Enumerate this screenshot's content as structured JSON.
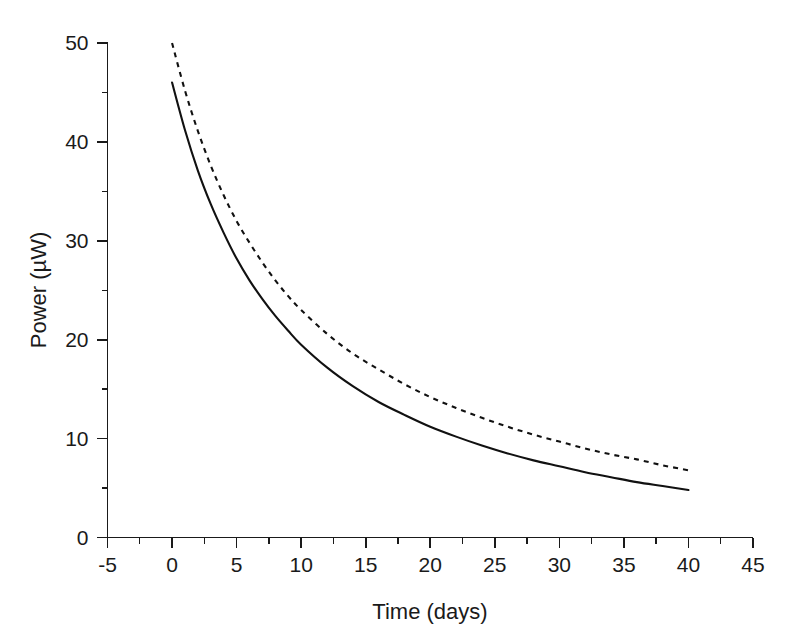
{
  "chart_data": {
    "type": "line",
    "title": "",
    "xlabel": "Time (days)",
    "ylabel": "Power (µW)",
    "xlim": [
      -5,
      45
    ],
    "ylim": [
      0,
      50
    ],
    "xticks": [
      -5,
      0,
      5,
      10,
      15,
      20,
      25,
      30,
      35,
      40,
      45
    ],
    "yticks": [
      0,
      10,
      20,
      30,
      40,
      50
    ],
    "xtick_labels": [
      "-5",
      "0",
      "5",
      "10",
      "15",
      "20",
      "25",
      "30",
      "35",
      "40",
      "45"
    ],
    "ytick_labels": [
      "0",
      "10",
      "20",
      "30",
      "40",
      "50"
    ],
    "x_minor_interval": 2.5,
    "y_minor_interval": 5,
    "grid": false,
    "legend": "none",
    "x": [
      0,
      1,
      2,
      3,
      4,
      5,
      6,
      7,
      8,
      9,
      10,
      12,
      14,
      16,
      18,
      20,
      22,
      24,
      26,
      28,
      30,
      32,
      34,
      36,
      38,
      40
    ],
    "series": [
      {
        "name": "dashed-curve",
        "style": "dashed",
        "color": "#111111",
        "values": [
          50.0,
          45.2,
          41.1,
          37.6,
          34.6,
          32.0,
          29.8,
          27.8,
          26.0,
          24.4,
          23.0,
          20.6,
          18.6,
          17.0,
          15.5,
          14.2,
          13.1,
          12.1,
          11.2,
          10.4,
          9.7,
          9.0,
          8.4,
          7.9,
          7.3,
          6.8
        ]
      },
      {
        "name": "solid-curve",
        "style": "solid",
        "color": "#111111",
        "values": [
          46.0,
          41.2,
          37.1,
          33.7,
          30.8,
          28.2,
          26.0,
          24.1,
          22.4,
          20.9,
          19.5,
          17.2,
          15.3,
          13.7,
          12.4,
          11.2,
          10.2,
          9.3,
          8.5,
          7.8,
          7.2,
          6.6,
          6.1,
          5.6,
          5.2,
          4.8
        ]
      }
    ]
  },
  "axes": {
    "x_axis_name": "x-axis",
    "y_axis_name": "y-axis"
  }
}
